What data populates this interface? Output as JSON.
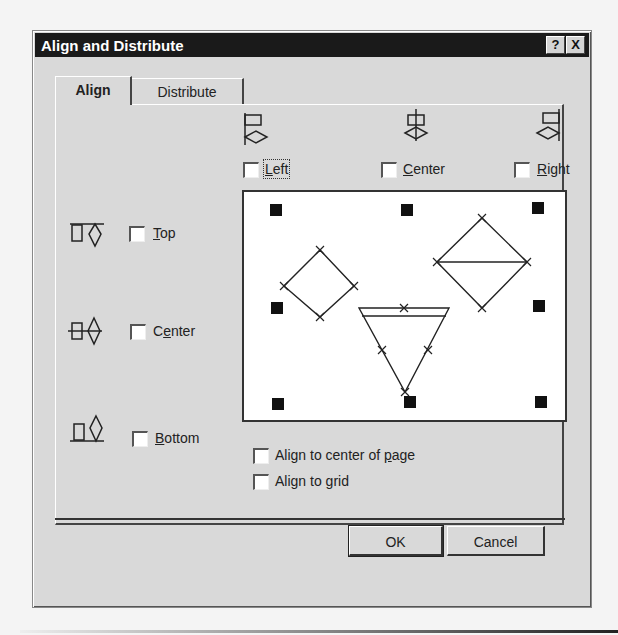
{
  "window": {
    "title": "Align and Distribute",
    "help_button": "?",
    "close_button": "X"
  },
  "tabs": [
    {
      "label": "Align",
      "active": true
    },
    {
      "label": "Distribute",
      "active": false
    }
  ],
  "horizontal": {
    "left": {
      "label": "Left",
      "mnemonic": "L",
      "rest": "eft",
      "checked": false,
      "icon": "align-left-icon"
    },
    "center": {
      "label": "Center",
      "mnemonic": "C",
      "rest": "enter",
      "checked": false,
      "icon": "align-center-horizontal-icon"
    },
    "right": {
      "label": "Right",
      "mnemonic": "R",
      "rest": "ight",
      "checked": false,
      "icon": "align-right-icon"
    }
  },
  "vertical": {
    "top": {
      "label": "Top",
      "mnemonic": "T",
      "rest": "op",
      "checked": false,
      "icon": "align-top-icon"
    },
    "center": {
      "label": "Center",
      "pre": "C",
      "mnemonic": "e",
      "rest": "nter",
      "checked": false,
      "icon": "align-center-vertical-icon"
    },
    "bottom": {
      "label": "Bottom",
      "mnemonic": "B",
      "rest": "ottom",
      "checked": false,
      "icon": "align-bottom-icon"
    }
  },
  "options": {
    "center_of_page": {
      "label": "Align to center of page",
      "pre": "Align to center of ",
      "mnemonic": "p",
      "rest": "age",
      "checked": false
    },
    "grid": {
      "label": "Align to grid",
      "pre": "Align to ",
      "mnemonic": "g",
      "rest": "rid",
      "checked": false
    }
  },
  "buttons": {
    "ok": "OK",
    "cancel": "Cancel"
  },
  "preview": {
    "description": "Preview showing a square, a diamond, and a triangle with nine black anchor markers"
  }
}
